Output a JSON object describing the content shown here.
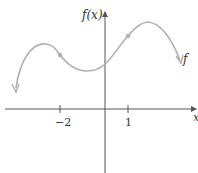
{
  "diagram": {
    "type": "function-graph",
    "y_axis_label": "f(x)",
    "x_axis_label": "x",
    "curve_label": "f",
    "ticks": [
      {
        "value": -2,
        "label": "−2"
      },
      {
        "value": 1,
        "label": "1"
      }
    ],
    "marked_points_x": [
      -2,
      1
    ],
    "colors": {
      "axis": "#555555",
      "curve": "#b0b0b0",
      "text": "#333333"
    }
  }
}
